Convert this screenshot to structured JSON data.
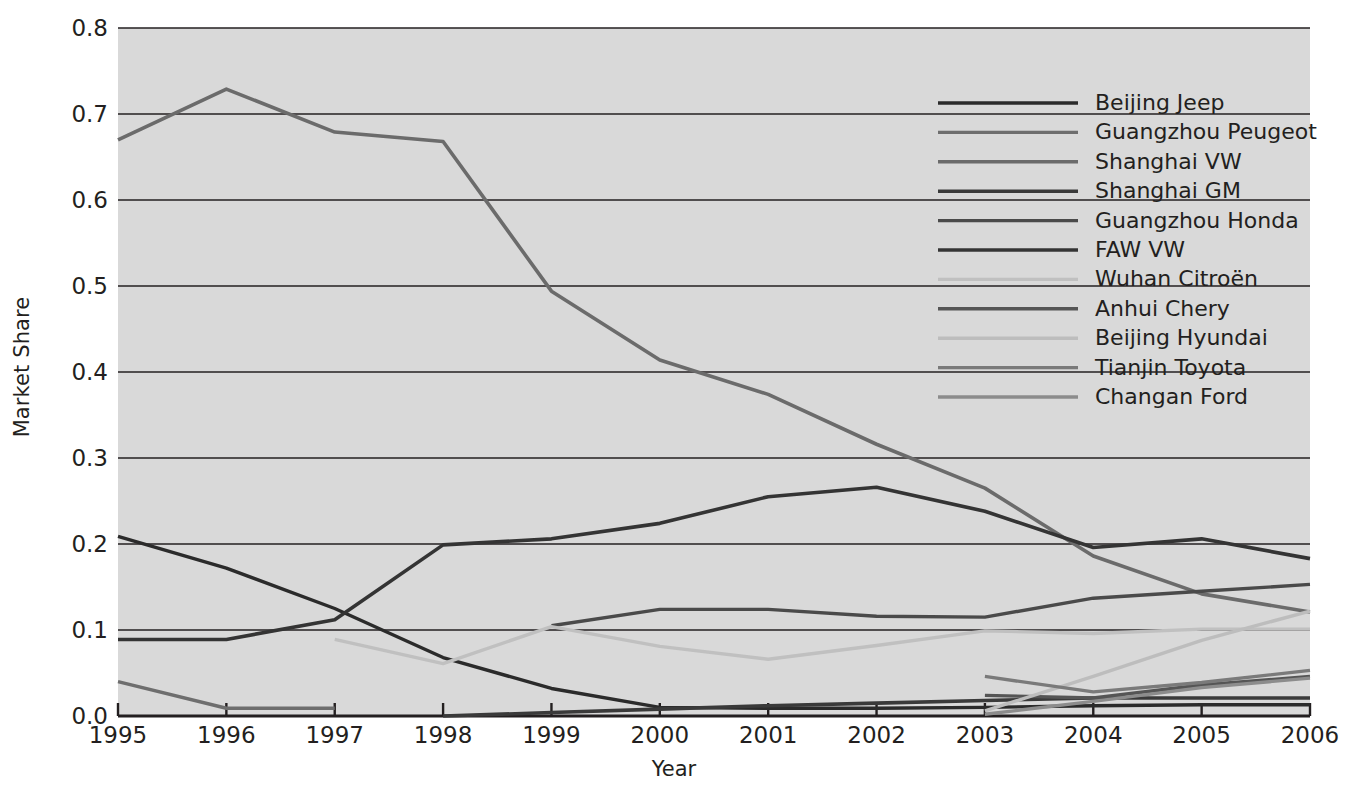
{
  "chart_data": {
    "type": "line",
    "title": "",
    "xlabel": "Year",
    "ylabel": "Market Share",
    "x": [
      1995,
      1996,
      1997,
      1998,
      1999,
      2000,
      2001,
      2002,
      2003,
      2004,
      2005,
      2006
    ],
    "xtick_labels": [
      "1995",
      "1996",
      "1997",
      "1998",
      "1999",
      "2000",
      "2001",
      "2002",
      "2003",
      "2004",
      "2005",
      "2006"
    ],
    "ytick_labels": [
      "0.0",
      "0.1",
      "0.2",
      "0.3",
      "0.4",
      "0.5",
      "0.6",
      "0.7",
      "0.8"
    ],
    "ytick_values": [
      0.0,
      0.1,
      0.2,
      0.3,
      0.4,
      0.5,
      0.6,
      0.7,
      0.8
    ],
    "ylim": [
      0.0,
      0.8
    ],
    "xlim": [
      1995,
      2006
    ],
    "grid": "horizontal",
    "legend_position": "upper-right-inside",
    "plot_background": "#d9d9d9",
    "gridline_color": "#231f20",
    "series": [
      {
        "name": "Beijing Jeep",
        "color": "#2b2b2b",
        "width": 3.4,
        "x": [
          1995,
          1996,
          1997,
          1998,
          1999,
          2000,
          2001,
          2002,
          2003,
          2004,
          2005,
          2006
        ],
        "values": [
          0.209,
          0.172,
          0.125,
          0.068,
          0.032,
          0.01,
          0.009,
          0.009,
          0.01,
          0.012,
          0.013,
          0.013
        ]
      },
      {
        "name": "Guangzhou Peugeot",
        "color": "#6e6e6e",
        "width": 3.4,
        "x": [
          1995,
          1996,
          1997
        ],
        "values": [
          0.04,
          0.009,
          0.009
        ]
      },
      {
        "name": "Shanghai VW",
        "color": "#6b6b6b",
        "width": 3.6,
        "x": [
          1995,
          1996,
          1997,
          1998,
          1999,
          2000,
          2001,
          2002,
          2003,
          2004,
          2005,
          2006
        ],
        "values": [
          0.67,
          0.729,
          0.679,
          0.668,
          0.494,
          0.414,
          0.374,
          0.316,
          0.265,
          0.186,
          0.142,
          0.121
        ]
      },
      {
        "name": "Shanghai GM",
        "color": "#3a3a3a",
        "width": 3.6,
        "x": [
          1998,
          1999,
          2000,
          2001,
          2002,
          2003,
          2004,
          2005,
          2006
        ],
        "values": [
          0.0,
          0.004,
          0.008,
          0.012,
          0.015,
          0.018,
          0.021,
          0.021,
          0.021
        ]
      },
      {
        "name": "Guangzhou Honda",
        "color": "#4a4a4a",
        "width": 3.4,
        "x": [
          1999,
          2000,
          2001,
          2002,
          2003,
          2004,
          2005,
          2006
        ],
        "values": [
          0.105,
          0.124,
          0.124,
          0.116,
          0.115,
          0.137,
          0.145,
          0.153
        ]
      },
      {
        "name": "FAW VW",
        "color": "#343434",
        "width": 3.6,
        "x": [
          1995,
          1996,
          1997,
          1998,
          1999,
          2000,
          2001,
          2002,
          2003,
          2004,
          2005,
          2006
        ],
        "values": [
          0.089,
          0.089,
          0.112,
          0.199,
          0.206,
          0.224,
          0.255,
          0.266,
          0.238,
          0.196,
          0.206,
          0.183
        ]
      },
      {
        "name": "Wuhan Citroën",
        "color": "#c0c0c0",
        "width": 3.4,
        "x": [
          1997,
          1998,
          1999,
          2000,
          2001,
          2002,
          2003,
          2004,
          2005,
          2006
        ],
        "values": [
          0.089,
          0.061,
          0.104,
          0.081,
          0.066,
          0.082,
          0.099,
          0.096,
          0.101,
          0.101
        ]
      },
      {
        "name": "Anhui Chery",
        "color": "#555555",
        "width": 3.4,
        "x": [
          2003,
          2004,
          2005,
          2006
        ],
        "values": [
          0.024,
          0.021,
          0.036,
          0.046
        ]
      },
      {
        "name": "Beijing Hyundai",
        "color": "#bdbdbd",
        "width": 3.4,
        "x": [
          2003,
          2004,
          2005,
          2006
        ],
        "values": [
          0.006,
          0.046,
          0.088,
          0.122
        ]
      },
      {
        "name": "Tianjin Toyota",
        "color": "#7a7a7a",
        "width": 3.4,
        "x": [
          2003,
          2004,
          2005,
          2006
        ],
        "values": [
          0.046,
          0.028,
          0.039,
          0.053
        ]
      },
      {
        "name": "Changan Ford",
        "color": "#8c8c8c",
        "width": 3.4,
        "x": [
          2003,
          2004,
          2005,
          2006
        ],
        "values": [
          0.002,
          0.017,
          0.033,
          0.044
        ]
      }
    ]
  }
}
